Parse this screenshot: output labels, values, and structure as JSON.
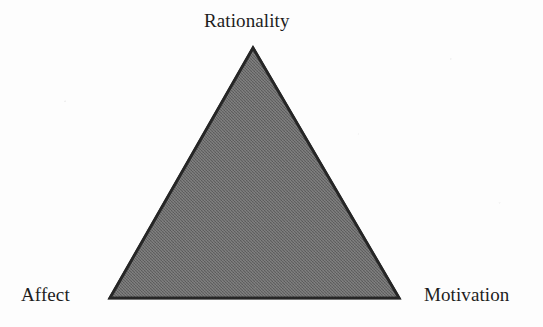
{
  "figure": {
    "background_color": "#fdfdfd",
    "shape": {
      "name": "triangle",
      "fill_color": "#6b6b6b",
      "fill_texture": "halftone-dither-gray",
      "stroke_color": "#262626",
      "stroke_width": 3,
      "vertices": {
        "apex": {
          "x": 253,
          "y": 48
        },
        "bottom_left": {
          "x": 110,
          "y": 298
        },
        "bottom_right": {
          "x": 399,
          "y": 298
        }
      }
    },
    "labels": [
      {
        "id": "rationality",
        "text": "Rationality",
        "position": "top-apex"
      },
      {
        "id": "affect",
        "text": "Affect",
        "position": "bottom-left"
      },
      {
        "id": "motivation",
        "text": "Motivation",
        "position": "bottom-right"
      }
    ]
  },
  "chart_data": {
    "type": "diagram",
    "subtype": "triangle-venn",
    "title": "",
    "categories": [
      "Rationality",
      "Affect",
      "Motivation"
    ],
    "values": [
      1,
      1,
      1
    ],
    "annotations": [
      "Rationality",
      "Affect",
      "Motivation"
    ],
    "legend": [],
    "grid": false,
    "xlabel": "",
    "ylabel": ""
  }
}
